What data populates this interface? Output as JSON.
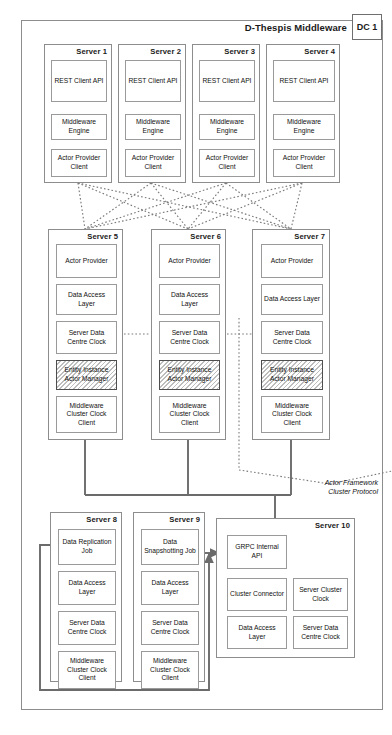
{
  "diagram": {
    "title": "D-Thespis Middleware",
    "badge": "DC 1",
    "annotation_line1": "Actor Framework",
    "annotation_line2": "Cluster Protocol",
    "colors": {
      "stroke": "#8d8d8d",
      "component_stroke": "#9a9a9a",
      "wire": "#6b6b6b",
      "hatch": "#bdbdbd"
    }
  },
  "tier_frontend": {
    "servers": [
      {
        "label": "Server 1",
        "components": [
          {
            "name": "REST Client API"
          },
          {
            "name": "Middleware Engine"
          },
          {
            "name": "Actor Provider Client"
          }
        ]
      },
      {
        "label": "Server 2",
        "components": [
          {
            "name": "REST Client API"
          },
          {
            "name": "Middleware Engine"
          },
          {
            "name": "Actor Provider Client"
          }
        ]
      },
      {
        "label": "Server 3",
        "components": [
          {
            "name": "REST Client API"
          },
          {
            "name": "Middleware Engine"
          },
          {
            "name": "Actor Provider Client"
          }
        ]
      },
      {
        "label": "Server 4",
        "components": [
          {
            "name": "REST Client API"
          },
          {
            "name": "Middleware Engine"
          },
          {
            "name": "Actor Provider Client"
          }
        ]
      }
    ]
  },
  "tier_actor": {
    "servers": [
      {
        "label": "Server 5",
        "components": [
          {
            "name": "Actor Provider"
          },
          {
            "name": "Data Access Layer"
          },
          {
            "name": "Server Data Centre Clock"
          },
          {
            "name": "Entity Instance Actor Manager",
            "hatched": true
          },
          {
            "name": "Middleware Cluster Clock Client"
          }
        ]
      },
      {
        "label": "Server 6",
        "components": [
          {
            "name": "Actor Provider"
          },
          {
            "name": "Data Access Layer"
          },
          {
            "name": "Server Data Centre Clock"
          },
          {
            "name": "Entity Instance Actor Manager",
            "hatched": true
          },
          {
            "name": "Middleware Cluster Clock Client"
          }
        ]
      },
      {
        "label": "Server 7",
        "components": [
          {
            "name": "Actor Provider"
          },
          {
            "name": "Data Access Layer"
          },
          {
            "name": "Server Data Centre Clock"
          },
          {
            "name": "Entity Instance Actor Manager",
            "hatched": true
          },
          {
            "name": "Middleware Cluster Clock Client"
          }
        ]
      }
    ]
  },
  "tier_jobs": {
    "servers": [
      {
        "label": "Server 8",
        "components": [
          {
            "name": "Data Replication Job"
          },
          {
            "name": "Data Access Layer"
          },
          {
            "name": "Server Data Centre Clock"
          },
          {
            "name": "Middleware Cluster Clock Client"
          }
        ]
      },
      {
        "label": "Server 9",
        "components": [
          {
            "name": "Data Snapshotting Job"
          },
          {
            "name": "Data Access Layer"
          },
          {
            "name": "Server Data Centre Clock"
          },
          {
            "name": "Middleware Cluster Clock Client"
          }
        ]
      }
    ],
    "cluster_server": {
      "label": "Server 10",
      "api": {
        "name": "GRPC Internal API"
      },
      "components": [
        {
          "name": "Cluster Connector"
        },
        {
          "name": "Server Cluster Clock"
        },
        {
          "name": "Data Access Layer"
        },
        {
          "name": "Server Data Centre Clock"
        }
      ]
    }
  }
}
